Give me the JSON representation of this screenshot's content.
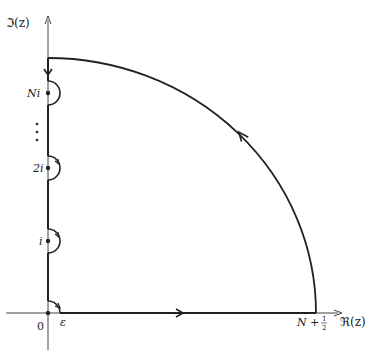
{
  "diagram": {
    "type": "contour-integral",
    "axes": {
      "imaginary_label": "ℑ(z)",
      "real_label": "ℜ(z)",
      "origin_label": "0"
    },
    "labels": {
      "epsilon": "ε",
      "radius": "N + ½",
      "radius_main": "N + ",
      "radius_num": "1",
      "radius_den": "2",
      "poles": [
        {
          "label": "Ni",
          "y": 93
        },
        {
          "label": "2i",
          "y": 168
        },
        {
          "label": "i",
          "y": 241
        }
      ],
      "ellipsis": "⋮"
    },
    "colors": {
      "stroke": "#222222",
      "axis": "#444444",
      "background": "#ffffff"
    }
  }
}
